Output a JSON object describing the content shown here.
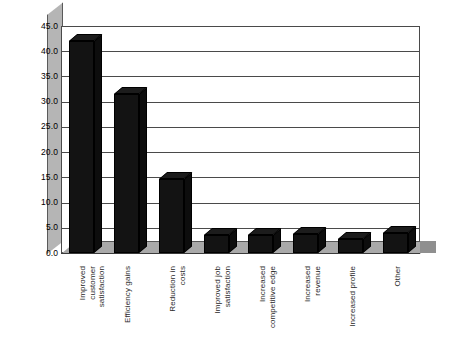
{
  "chart_data": {
    "type": "bar",
    "title": "",
    "subtitle": "",
    "xlabel": "",
    "ylabel": "",
    "ylim": [
      0,
      45
    ],
    "ytick_step": 5,
    "ytick_labels": [
      "45.0",
      "40.0",
      "35.0",
      "30.0",
      "25.0",
      "20.0",
      "15.0",
      "10.0",
      "5.0",
      "0.0"
    ],
    "ytick_values": [
      45,
      40,
      35,
      30,
      25,
      20,
      15,
      10,
      5,
      0
    ],
    "grid": true,
    "legend": "none",
    "style": "3d-column",
    "bar_color": "#131313",
    "floor_color": "#a9a9a9",
    "axis_color": "#4a4a4a",
    "categories": [
      "Improved customer satisfaction",
      "Efficiency gains",
      "Reduction in costs",
      "Improved job satisfaction",
      "Increased competitive edge",
      "Increased revenue",
      "Increased profile",
      "Other"
    ],
    "category_lines": [
      [
        "Improved",
        "customer",
        "satisfaction"
      ],
      [
        "Efficiency gains"
      ],
      [
        "Reduction in",
        "costs"
      ],
      [
        "Improved job",
        "satisfaction"
      ],
      [
        "Increased",
        "competitive edge"
      ],
      [
        "Increased",
        "revenue"
      ],
      [
        "Increased profile"
      ],
      [
        "Other"
      ]
    ],
    "values": [
      42.0,
      31.6,
      14.7,
      3.5,
      3.6,
      3.8,
      2.8,
      4.0
    ]
  }
}
